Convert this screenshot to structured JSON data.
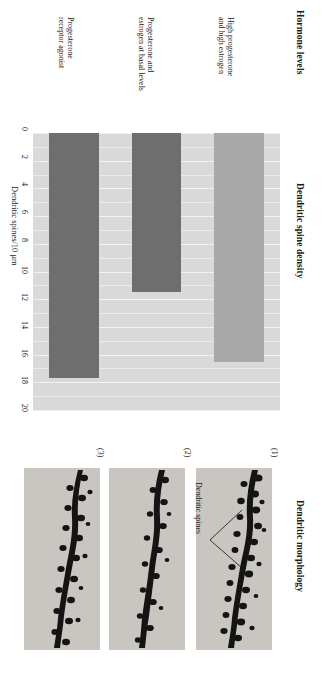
{
  "figure": {
    "orientation": "rotated-90",
    "background": "#ffffff"
  },
  "sections": {
    "hormone_levels_heading": "Hormone levels",
    "spine_density_heading": "Dendritic spine density",
    "morphology_heading": "Dendritic morphology"
  },
  "chart_data": {
    "type": "bar",
    "orientation": "horizontal",
    "title": "Dendritic spine density",
    "xlabel": "Hormone levels",
    "ylabel": "Dendritic spines/10 μm",
    "ylim": [
      0,
      20
    ],
    "ticks": [
      "0",
      "2",
      "4",
      "6",
      "8",
      "10",
      "12",
      "14",
      "16",
      "18",
      "20"
    ],
    "tick_step": 2,
    "grid": true,
    "grid_color": "#f2f2f2",
    "plot_background": "#d9d9d9",
    "categories": [
      "Progesterone receptor agonist",
      "Progesterone and estrogen at basal levels",
      "High progesterone and high estrogen"
    ],
    "values": [
      16.5,
      11.5,
      17.7
    ],
    "bar_colors": [
      "#a8a8a8",
      "#6e6e6e",
      "#6e6e6e"
    ],
    "bars": [
      {
        "label_line1": "Progesterone",
        "label_line2": "receptor agonist",
        "value": 16.5,
        "color": "#a8a8a8"
      },
      {
        "label_line1": "Progesterone and",
        "label_line2": "estrogen at basal levels",
        "value": 11.5,
        "color": "#6e6e6e"
      },
      {
        "label_line1": "High progesterone",
        "label_line2": "and high estrogen",
        "value": 17.7,
        "color": "#6e6e6e"
      }
    ]
  },
  "morphology": {
    "heading": "Dendritic morphology",
    "annotation": "Dendritic spines",
    "panels": [
      {
        "number": "(1)"
      },
      {
        "number": "(2)"
      },
      {
        "number": "(3)"
      }
    ]
  }
}
